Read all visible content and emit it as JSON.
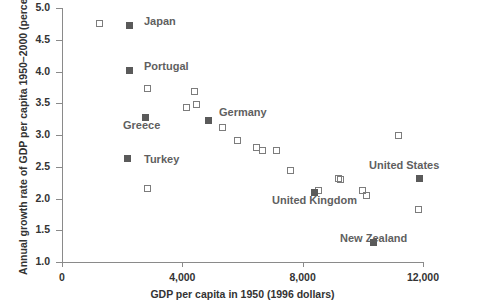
{
  "chart_data": {
    "type": "scatter",
    "title": "",
    "xlabel": "GDP per capita in 1950 (1996 dollars)",
    "ylabel": "Annual growth rate of GDP per capita 1950–2000 (percent)",
    "xlim": [
      0,
      12000
    ],
    "ylim": [
      1.0,
      5.0
    ],
    "xticks": [
      0,
      4000,
      8000,
      12000
    ],
    "xticklabels": [
      "0",
      "4,000",
      "8,000",
      "12,000"
    ],
    "yticks": [
      1.0,
      1.5,
      2.0,
      2.5,
      3.0,
      3.5,
      4.0,
      4.5,
      5.0
    ],
    "yticklabels": [
      "1.0",
      "1.5",
      "2.0",
      "2.5",
      "3.0",
      "3.5",
      "4.0",
      "4.5",
      "5.0"
    ],
    "grid": false,
    "legend": null,
    "marker_styles": {
      "unlabeled": "open square",
      "labeled": "filled square"
    },
    "points": [
      {
        "x": 1230,
        "y": 4.76,
        "label": "",
        "marker": "hollow"
      },
      {
        "x": 2230,
        "y": 4.72,
        "label": "Japan",
        "marker": "filled"
      },
      {
        "x": 2260,
        "y": 4.01,
        "label": "Portugal",
        "marker": "filled"
      },
      {
        "x": 2840,
        "y": 3.74,
        "label": "",
        "marker": "hollow"
      },
      {
        "x": 2790,
        "y": 3.28,
        "label": "Greece",
        "marker": "filled"
      },
      {
        "x": 2190,
        "y": 2.63,
        "label": "Turkey",
        "marker": "filled"
      },
      {
        "x": 2840,
        "y": 2.15,
        "label": "",
        "marker": "hollow"
      },
      {
        "x": 4420,
        "y": 3.69,
        "label": "",
        "marker": "hollow"
      },
      {
        "x": 4150,
        "y": 3.43,
        "label": "",
        "marker": "hollow"
      },
      {
        "x": 4480,
        "y": 3.48,
        "label": "",
        "marker": "hollow"
      },
      {
        "x": 4880,
        "y": 3.23,
        "label": "Germany",
        "marker": "filled"
      },
      {
        "x": 5350,
        "y": 3.12,
        "label": "",
        "marker": "hollow"
      },
      {
        "x": 5850,
        "y": 2.91,
        "label": "",
        "marker": "hollow"
      },
      {
        "x": 6480,
        "y": 2.81,
        "label": "",
        "marker": "hollow"
      },
      {
        "x": 6680,
        "y": 2.76,
        "label": "",
        "marker": "hollow"
      },
      {
        "x": 7140,
        "y": 2.76,
        "label": "",
        "marker": "hollow"
      },
      {
        "x": 7610,
        "y": 2.44,
        "label": "",
        "marker": "hollow"
      },
      {
        "x": 8510,
        "y": 2.13,
        "label": "",
        "marker": "hollow"
      },
      {
        "x": 8400,
        "y": 2.1,
        "label": "United Kingdom",
        "marker": "filled"
      },
      {
        "x": 9200,
        "y": 2.31,
        "label": "",
        "marker": "hollow"
      },
      {
        "x": 11200,
        "y": 2.99,
        "label": "",
        "marker": "hollow"
      },
      {
        "x": 9270,
        "y": 2.3,
        "label": "",
        "marker": "hollow"
      },
      {
        "x": 9990,
        "y": 2.13,
        "label": "",
        "marker": "hollow"
      },
      {
        "x": 10120,
        "y": 2.05,
        "label": "",
        "marker": "hollow"
      },
      {
        "x": 11900,
        "y": 2.31,
        "label": "United States",
        "marker": "filled"
      },
      {
        "x": 11860,
        "y": 1.83,
        "label": "",
        "marker": "hollow"
      },
      {
        "x": 10350,
        "y": 1.3,
        "label": "New Zealand",
        "marker": "filled"
      }
    ],
    "annotations": [
      {
        "text": "Japan",
        "x_px": 144,
        "y_px": 15,
        "align": "left"
      },
      {
        "text": "Portugal",
        "x_px": 144,
        "y_px": 60,
        "align": "left"
      },
      {
        "text": "Greece",
        "x_px": 123,
        "y_px": 119,
        "align": "left"
      },
      {
        "text": "Turkey",
        "x_px": 144,
        "y_px": 153,
        "align": "left"
      },
      {
        "text": "Germany",
        "x_px": 219,
        "y_px": 106,
        "align": "left"
      },
      {
        "text": "United Kingdom",
        "x_px": 272,
        "y_px": 194,
        "align": "left"
      },
      {
        "text": "United States",
        "x_px": 369,
        "y_px": 159,
        "align": "left"
      },
      {
        "text": "New Zealand",
        "x_px": 340,
        "y_px": 232,
        "align": "left"
      }
    ]
  },
  "axes": {
    "x_label": "GDP per capita in 1950 (1996 dollars)",
    "y_label": "Annual growth rate of GDP per capita 1950–2000 (percent)"
  }
}
